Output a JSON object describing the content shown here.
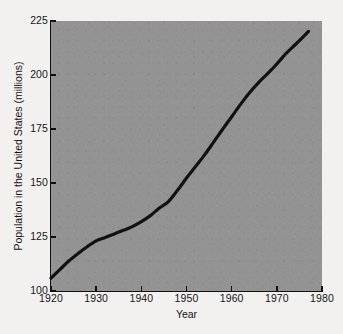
{
  "chart_data": {
    "type": "line",
    "title": "",
    "xlabel": "Year",
    "ylabel": "Population in the United States (millions)",
    "xlim": [
      1920,
      1980
    ],
    "ylim": [
      100,
      225
    ],
    "grid": false,
    "legend": null,
    "background_color": "#939393",
    "line_color": "#111111",
    "page_color": "#f3f1f0",
    "xticks": [
      1920,
      1930,
      1940,
      1950,
      1960,
      1970,
      1980
    ],
    "xtick_labels": [
      "1920",
      "1930",
      "1940",
      "1950",
      "1960",
      "1970",
      "1980"
    ],
    "yticks": [
      100,
      125,
      150,
      175,
      200,
      225
    ],
    "ytick_labels": [
      "100",
      "125",
      "150",
      "175",
      "200",
      "225"
    ],
    "series": [
      {
        "name": "US population",
        "x": [
          1920,
          1922,
          1924,
          1926,
          1928,
          1930,
          1932,
          1934,
          1936,
          1938,
          1940,
          1942,
          1944,
          1946,
          1948,
          1950,
          1952,
          1954,
          1956,
          1958,
          1960,
          1962,
          1964,
          1966,
          1968,
          1970,
          1972,
          1974,
          1976,
          1977
        ],
        "y": [
          106.0,
          110.0,
          114.0,
          117.4,
          120.5,
          123.2,
          124.8,
          126.4,
          128.1,
          129.8,
          132.1,
          134.9,
          138.4,
          141.4,
          146.6,
          152.3,
          157.6,
          163.0,
          168.9,
          174.9,
          180.7,
          186.5,
          191.9,
          196.6,
          200.7,
          205.1,
          209.9,
          213.9,
          218.0,
          220.2
        ],
        "color": "#111111",
        "line_width": 3.2
      }
    ]
  },
  "axis": {
    "x_title": "Year",
    "y_title": "Population in the United States (millions)"
  }
}
